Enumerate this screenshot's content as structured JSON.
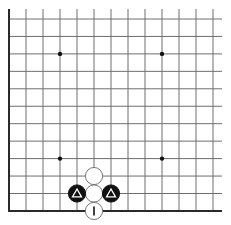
{
  "board": {
    "description": "Go board corner (lower-left) diagram",
    "columns": 13,
    "rows": 12,
    "origin_x": 9,
    "origin_y": 19,
    "spacing_x": 17,
    "spacing_y": 17.45,
    "grid_top": 9,
    "grid_right": 222,
    "edges": [
      "left",
      "bottom"
    ],
    "colors": {
      "background": "#ffffff",
      "line": "#6e6e6e",
      "edge_line": "#2a2a2a",
      "black_stone": "#111111",
      "white_stone": "#ffffff",
      "stone_outline": "#777777"
    },
    "star_points": [
      {
        "col": 3,
        "row": 2
      },
      {
        "col": 9,
        "row": 2
      },
      {
        "col": 3,
        "row": 8
      },
      {
        "col": 9,
        "row": 8
      }
    ],
    "stones": [
      {
        "col": 5,
        "row": 9,
        "color": "white",
        "mark": "none"
      },
      {
        "col": 5,
        "row": 10,
        "color": "white",
        "mark": "none"
      },
      {
        "col": 5,
        "row": 11,
        "color": "white",
        "mark": "line"
      },
      {
        "col": 4,
        "row": 10,
        "color": "black",
        "mark": "triangle"
      },
      {
        "col": 6,
        "row": 10,
        "color": "black",
        "mark": "triangle"
      }
    ]
  }
}
